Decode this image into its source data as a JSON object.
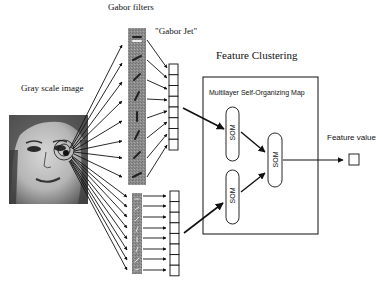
{
  "labels": {
    "gabor_filters": "Gabor filters",
    "gabor_jet": "\"Gabor Jet\"",
    "gray_scale_image": "Gray scale image",
    "feature_clustering": "Feature Clustering",
    "msom_box_title": "Multilayer Self-Organizing Map",
    "feature_value": "Feature value"
  },
  "som_nodes": [
    {
      "id": "som-1",
      "label": "SOM"
    },
    {
      "id": "som-2",
      "label": "SOM"
    },
    {
      "id": "som-3",
      "label": "SOM"
    }
  ],
  "jets": {
    "top_cells": 8,
    "bottom_cells": 8
  },
  "colors": {
    "ink": "#111111",
    "filter_strip": "#8a8a8a",
    "face_bg": "#9a9a9a"
  }
}
